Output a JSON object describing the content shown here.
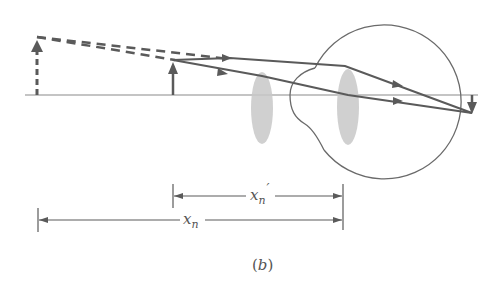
{
  "figure": {
    "caption": "(b)",
    "caption_parts": {
      "open": "(",
      "letter": "b",
      "close": ")"
    }
  },
  "labels": {
    "near_point_image_distance": {
      "base": "x",
      "sub": "n",
      "prime": "′"
    },
    "near_point_distance": {
      "base": "x",
      "sub": "n"
    }
  },
  "colors": {
    "line": "#5a5a5a",
    "lens_fill": "#c8c8c8",
    "axis": "#8a8a8a"
  },
  "elements": {
    "optical_axis": {
      "x1": 25,
      "x2": 478,
      "y": 95
    },
    "virtual_image_arrow": {
      "x": 37,
      "y_base": 95,
      "y_tip": 37,
      "style": "dashed"
    },
    "object_arrow": {
      "x": 173,
      "y_base": 95,
      "y_tip": 60
    },
    "magnifier_lens": {
      "cx": 262,
      "cy": 108,
      "rx": 11,
      "ry": 36
    },
    "eye_lens": {
      "cx": 348,
      "cy": 108,
      "rx": 11,
      "ry": 37
    },
    "eyeball": {
      "cx": 397,
      "cy": 92,
      "r": 77
    },
    "retina_image": {
      "x": 472,
      "y_base": 95,
      "y_tip": 113
    }
  },
  "dimensions": [
    {
      "id": "xn_prime",
      "x1": 173,
      "x2": 343,
      "y": 196
    },
    {
      "id": "xn",
      "x1": 38,
      "x2": 343,
      "y": 220
    }
  ]
}
